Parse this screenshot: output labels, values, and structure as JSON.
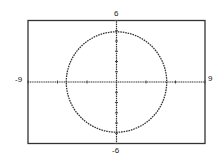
{
  "chart_data": {
    "type": "line",
    "title": "",
    "equation": "x^2 + y^2 = 25",
    "series": [
      {
        "name": "circle",
        "center": [
          0,
          0
        ],
        "radius": 5
      }
    ],
    "xlim": [
      -9,
      9
    ],
    "ylim": [
      -6,
      6
    ],
    "xscale": 3,
    "yscale": 1,
    "xlabel": "",
    "ylabel": "",
    "grid": false,
    "tick_labels": {
      "x_min": "-9",
      "x_max": "9",
      "y_max": "6",
      "y_min": "-6"
    }
  },
  "labels": {
    "xmin": "-9",
    "xmax": "9",
    "ymax": "6",
    "ymin": "-6"
  }
}
